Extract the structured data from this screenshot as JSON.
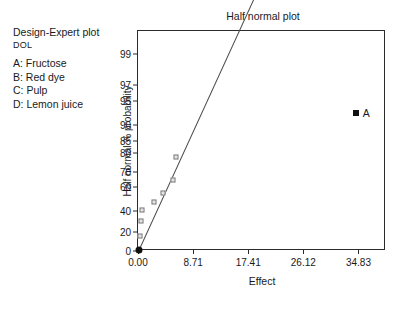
{
  "legend": {
    "title": "Design-Expert plot",
    "response": "DOL",
    "factors": [
      "A: Fructose",
      "B: Red dye",
      "C: Pulp",
      "D: Lemon juice"
    ]
  },
  "chart_data": {
    "type": "scatter",
    "title": "Half normal plot",
    "xlabel": "Effect",
    "ylabel": "Half normal % probability",
    "xlim": [
      0,
      39.18
    ],
    "xticks": [
      0,
      8.71,
      17.41,
      26.12,
      34.83
    ],
    "xticklabels": [
      "0.00",
      "8.71",
      "17.41",
      "26.12",
      "34.83"
    ],
    "yticks": [
      0,
      20,
      40,
      60,
      70,
      80,
      85,
      90,
      95,
      97,
      99
    ],
    "yticklabels": [
      "0",
      "20",
      "40",
      "60",
      "70",
      "80",
      "85",
      "90",
      "95",
      "97",
      "99"
    ],
    "grid": false,
    "legend_position": "none",
    "points": [
      {
        "effect": 0.12,
        "probability": 1.5,
        "marker": "filled-circle",
        "label": ""
      },
      {
        "effect": 0.35,
        "probability": 16.0,
        "marker": "open-square",
        "label": ""
      },
      {
        "effect": 0.45,
        "probability": 31.0,
        "marker": "open-square",
        "label": ""
      },
      {
        "effect": 0.62,
        "probability": 41.0,
        "marker": "open-square",
        "label": ""
      },
      {
        "effect": 2.6,
        "probability": 48.0,
        "marker": "open-square",
        "label": ""
      },
      {
        "effect": 3.95,
        "probability": 55.0,
        "marker": "open-square",
        "label": ""
      },
      {
        "effect": 5.6,
        "probability": 65.0,
        "marker": "open-square",
        "label": ""
      },
      {
        "effect": 5.95,
        "probability": 78.0,
        "marker": "open-square",
        "label": ""
      },
      {
        "effect": 34.4,
        "probability": 93.0,
        "marker": "filled-square",
        "label": "A"
      }
    ],
    "fit_line": {
      "x0": 0.15,
      "y0": 2.0,
      "x1": 18.2,
      "y1": 99.9
    }
  }
}
